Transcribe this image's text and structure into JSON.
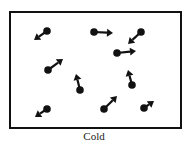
{
  "diagram": {
    "caption": "Cold",
    "stroke_color": "#111111",
    "background": "#ffffff",
    "container": {
      "x": 10,
      "y": 12,
      "width": 171,
      "height": 116,
      "stroke_width": 2
    },
    "molecules": [
      {
        "ball": [
          47,
          31
        ],
        "tip": [
          34,
          40
        ],
        "direction": "down-left"
      },
      {
        "ball": [
          94,
          32
        ],
        "tip": [
          113,
          33
        ],
        "direction": "right"
      },
      {
        "ball": [
          141,
          32
        ],
        "tip": [
          128,
          44
        ],
        "direction": "down-left"
      },
      {
        "ball": [
          117,
          53
        ],
        "tip": [
          136,
          51
        ],
        "direction": "right"
      },
      {
        "ball": [
          48,
          70
        ],
        "tip": [
          63,
          59
        ],
        "direction": "up-right"
      },
      {
        "ball": [
          80,
          90
        ],
        "tip": [
          76,
          74
        ],
        "direction": "up"
      },
      {
        "ball": [
          132,
          85
        ],
        "tip": [
          128,
          70
        ],
        "direction": "up"
      },
      {
        "ball": [
          47,
          109
        ],
        "tip": [
          35,
          117
        ],
        "direction": "down-left"
      },
      {
        "ball": [
          104,
          109
        ],
        "tip": [
          117,
          96
        ],
        "direction": "up-right"
      },
      {
        "ball": [
          144,
          108
        ],
        "tip": [
          154,
          101
        ],
        "direction": "up-right"
      }
    ]
  }
}
